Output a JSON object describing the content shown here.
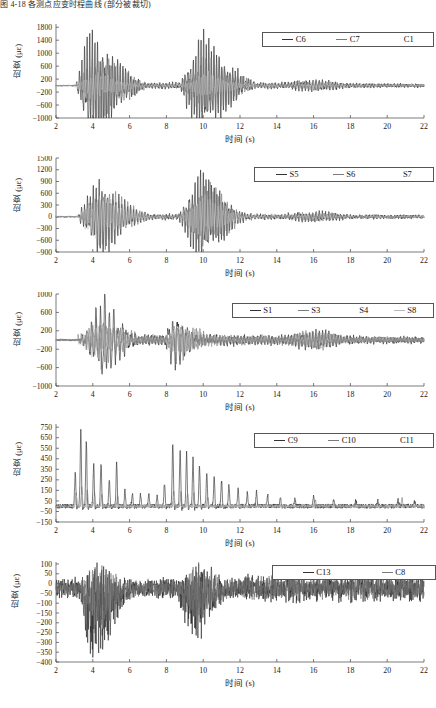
{
  "caption": {
    "top_text_clipped": "图 4-18 各测点应变时程曲线 (部分被裁切)"
  },
  "figure": {
    "axis_x_label": "时间 (s)",
    "axis_y_label": "应变 (με)",
    "x_ticks": [
      2,
      4,
      6,
      8,
      10,
      12,
      14,
      16,
      18,
      20,
      22
    ],
    "xlim": [
      2,
      22
    ]
  },
  "colors": {
    "trace_dark": "#2a2a2a",
    "trace_mid": "#6f6f6f",
    "trace_light": "#bdbdbd",
    "trace_extra": "#8c8c8c",
    "axis": "#444444",
    "text": "#1a1a1a",
    "legend_border": "#555555",
    "background": "#ffffff"
  },
  "chart_data": [
    {
      "id": "panel-1",
      "type": "line",
      "title": "",
      "xlabel": "时间 (s)",
      "ylabel": "应变 (με)",
      "xlim": [
        2,
        22
      ],
      "ylim": [
        -1000,
        1900
      ],
      "x_ticks": [
        2,
        4,
        6,
        8,
        10,
        12,
        14,
        16,
        18,
        20,
        22
      ],
      "y_ticks": [
        1800,
        1400,
        1000,
        600,
        200,
        -200,
        -600,
        -1000
      ],
      "grid": false,
      "legend_position": "top-right",
      "series": [
        {
          "name": "C6",
          "style": "dark",
          "seed": 11,
          "burst1": {
            "start": 3.1,
            "peak": 3.8,
            "end": 7.0,
            "amp": 1750,
            "freq": 7.2
          },
          "burst2": {
            "start": 8.7,
            "peak": 9.9,
            "end": 13.0,
            "amp": 1600,
            "freq": 7.0
          },
          "tail_amp": 200,
          "noise": 45,
          "baseline": 0
        },
        {
          "name": "C7",
          "style": "mid",
          "seed": 29,
          "burst1": {
            "start": 3.2,
            "peak": 4.2,
            "end": 7.4,
            "amp": 1100,
            "freq": 6.6
          },
          "burst2": {
            "start": 8.8,
            "peak": 10.3,
            "end": 13.2,
            "amp": 1000,
            "freq": 6.8
          },
          "tail_amp": 160,
          "noise": 38,
          "baseline": 0
        },
        {
          "name": "C1",
          "style": "light",
          "seed": 47,
          "burst1": {
            "start": 3.0,
            "peak": 4.0,
            "end": 7.0,
            "amp": 420,
            "freq": 7.6
          },
          "burst2": {
            "start": 8.8,
            "peak": 10.1,
            "end": 12.8,
            "amp": 380,
            "freq": 7.4
          },
          "tail_amp": 120,
          "noise": 30,
          "baseline": 0
        }
      ]
    },
    {
      "id": "panel-2",
      "type": "line",
      "title": "",
      "xlabel": "时间 (s)",
      "ylabel": "应变 (με)",
      "xlim": [
        2,
        22
      ],
      "ylim": [
        -900,
        1500
      ],
      "x_ticks": [
        2,
        4,
        6,
        8,
        10,
        12,
        14,
        16,
        18,
        20,
        22
      ],
      "y_ticks": [
        1500,
        1200,
        900,
        600,
        300,
        0,
        -300,
        -600,
        -900
      ],
      "grid": false,
      "legend_position": "top-right",
      "series": [
        {
          "name": "S5",
          "style": "dark",
          "seed": 73,
          "burst1": {
            "start": 3.2,
            "peak": 4.3,
            "end": 7.2,
            "amp": 980,
            "freq": 6.4
          },
          "burst2": {
            "start": 8.6,
            "peak": 9.8,
            "end": 12.6,
            "amp": 1180,
            "freq": 6.6
          },
          "tail_amp": 150,
          "noise": 40,
          "baseline": 0
        },
        {
          "name": "S6",
          "style": "mid",
          "seed": 97,
          "burst1": {
            "start": 3.3,
            "peak": 4.5,
            "end": 7.6,
            "amp": 760,
            "freq": 6.2
          },
          "burst2": {
            "start": 8.8,
            "peak": 10.2,
            "end": 12.8,
            "amp": 840,
            "freq": 6.4
          },
          "tail_amp": 120,
          "noise": 34,
          "baseline": 0
        },
        {
          "name": "S7",
          "style": "light",
          "seed": 131,
          "burst1": {
            "start": 3.1,
            "peak": 4.2,
            "end": 7.2,
            "amp": 560,
            "freq": 6.9
          },
          "burst2": {
            "start": 8.7,
            "peak": 10.0,
            "end": 12.4,
            "amp": 520,
            "freq": 7.1
          },
          "tail_amp": 90,
          "noise": 26,
          "baseline": 0
        }
      ]
    },
    {
      "id": "panel-3",
      "type": "line",
      "title": "",
      "xlabel": "时间 (s)",
      "ylabel": "应变 (με)",
      "xlim": [
        2,
        22
      ],
      "ylim": [
        -1000,
        1000
      ],
      "x_ticks": [
        2,
        4,
        6,
        8,
        10,
        12,
        14,
        16,
        18,
        20,
        22
      ],
      "y_ticks": [
        1000,
        600,
        200,
        -200,
        -600,
        -1000
      ],
      "grid": false,
      "legend_position": "top-right",
      "series": [
        {
          "name": "S1",
          "style": "dark",
          "seed": 151,
          "burst1": {
            "start": 3.4,
            "peak": 4.6,
            "end": 6.6,
            "amp": 930,
            "freq": 4.2
          },
          "burst2": {
            "start": 7.8,
            "peak": 8.4,
            "end": 10.0,
            "amp": 620,
            "freq": 4.0
          },
          "tail_amp": 230,
          "noise": 55,
          "baseline": 0
        },
        {
          "name": "S3",
          "style": "mid",
          "seed": 173,
          "burst1": {
            "start": 3.2,
            "peak": 4.4,
            "end": 7.0,
            "amp": 520,
            "freq": 5.2
          },
          "burst2": {
            "start": 7.8,
            "peak": 8.6,
            "end": 11.0,
            "amp": 430,
            "freq": 5.0
          },
          "tail_amp": 200,
          "noise": 48,
          "baseline": 0
        },
        {
          "name": "S4",
          "style": "light",
          "seed": 197,
          "burst1": {
            "start": 3.2,
            "peak": 4.1,
            "end": 7.0,
            "amp": 380,
            "freq": 5.8
          },
          "burst2": {
            "start": 7.9,
            "peak": 8.8,
            "end": 11.2,
            "amp": 330,
            "freq": 5.6
          },
          "tail_amp": 150,
          "noise": 36,
          "baseline": 0
        },
        {
          "name": "S8",
          "style": "extra",
          "seed": 211,
          "burst1": {
            "start": 3.3,
            "peak": 4.3,
            "end": 7.2,
            "amp": 300,
            "freq": 6.4
          },
          "burst2": {
            "start": 7.8,
            "peak": 8.7,
            "end": 11.4,
            "amp": 260,
            "freq": 6.2
          },
          "tail_amp": 170,
          "noise": 40,
          "baseline": 0
        }
      ]
    },
    {
      "id": "panel-4",
      "type": "line",
      "title": "",
      "xlabel": "时间 (s)",
      "ylabel": "应变 (με)",
      "xlim": [
        2,
        22
      ],
      "ylim": [
        -150,
        780
      ],
      "x_ticks": [
        2,
        4,
        6,
        8,
        10,
        12,
        14,
        16,
        18,
        20,
        22
      ],
      "y_ticks": [
        750,
        650,
        550,
        450,
        350,
        250,
        150,
        50,
        -50,
        -150
      ],
      "grid": false,
      "legend_position": "top-right",
      "spiky": true,
      "series": [
        {
          "name": "C9",
          "style": "dark",
          "seed": 233,
          "noise": 22,
          "baseline": 0,
          "spikes": [
            [
              3.05,
              330
            ],
            [
              3.35,
              740
            ],
            [
              3.65,
              640
            ],
            [
              4.05,
              420
            ],
            [
              4.45,
              430
            ],
            [
              4.9,
              260
            ],
            [
              5.3,
              420
            ],
            [
              5.75,
              150
            ],
            [
              6.15,
              130
            ],
            [
              6.6,
              110
            ],
            [
              7.05,
              120
            ],
            [
              7.5,
              95
            ],
            [
              7.9,
              230
            ],
            [
              8.35,
              620
            ],
            [
              8.75,
              560
            ],
            [
              9.1,
              520
            ],
            [
              9.45,
              470
            ],
            [
              9.8,
              400
            ],
            [
              10.2,
              330
            ],
            [
              10.6,
              290
            ],
            [
              11.0,
              250
            ],
            [
              11.4,
              200
            ],
            [
              11.9,
              170
            ],
            [
              12.4,
              130
            ],
            [
              12.9,
              150
            ],
            [
              13.5,
              110
            ],
            [
              14.2,
              80
            ],
            [
              15.0,
              70
            ],
            [
              16.0,
              95
            ],
            [
              17.1,
              60
            ],
            [
              18.3,
              55
            ],
            [
              19.5,
              50
            ],
            [
              20.6,
              60
            ],
            [
              21.5,
              45
            ]
          ]
        },
        {
          "name": "C10",
          "style": "mid",
          "seed": 257,
          "noise": 18,
          "baseline": 0,
          "spikes": [
            [
              3.1,
              120
            ],
            [
              3.4,
              180
            ],
            [
              3.7,
              160
            ],
            [
              4.1,
              130
            ],
            [
              4.5,
              120
            ],
            [
              5.35,
              110
            ],
            [
              8.4,
              150
            ],
            [
              8.8,
              140
            ],
            [
              9.15,
              130
            ],
            [
              9.5,
              120
            ],
            [
              10.25,
              100
            ],
            [
              16.1,
              60
            ],
            [
              20.8,
              80
            ]
          ]
        },
        {
          "name": "C11",
          "style": "light",
          "seed": 281,
          "noise": 14,
          "baseline": 0,
          "spikes": [
            [
              3.12,
              90
            ],
            [
              3.42,
              110
            ],
            [
              4.12,
              85
            ],
            [
              8.42,
              95
            ],
            [
              9.18,
              80
            ],
            [
              16.05,
              40
            ]
          ]
        }
      ]
    },
    {
      "id": "panel-5",
      "type": "line",
      "title": "",
      "xlabel": "时间 (s)",
      "ylabel": "应变 (με)",
      "xlim": [
        2,
        22
      ],
      "ylim": [
        -400,
        110
      ],
      "x_ticks": [
        2,
        4,
        6,
        8,
        10,
        12,
        14,
        16,
        18,
        20,
        22
      ],
      "y_ticks": [
        100,
        50,
        0,
        -50,
        -100,
        -150,
        -200,
        -250,
        -300,
        -350,
        -400
      ],
      "grid": false,
      "legend_position": "top-right",
      "noisy": true,
      "series": [
        {
          "name": "C13",
          "style": "dark",
          "seed": 307,
          "baseline": -25,
          "noise": 33,
          "burst1": {
            "start": 3.2,
            "peak": 4.0,
            "end": 6.3,
            "amp": 290,
            "freq": 22,
            "bias": -0.55
          },
          "burst2": {
            "start": 8.4,
            "peak": 9.6,
            "end": 11.6,
            "amp": 215,
            "freq": 21,
            "bias": -0.35
          },
          "tail_amp": 55
        },
        {
          "name": "C8",
          "style": "mid",
          "seed": 331,
          "baseline": -22,
          "noise": 27,
          "burst1": {
            "start": 3.3,
            "peak": 4.2,
            "end": 6.5,
            "amp": 170,
            "freq": 20,
            "bias": -0.4
          },
          "burst2": {
            "start": 8.5,
            "peak": 9.7,
            "end": 11.8,
            "amp": 140,
            "freq": 19,
            "bias": -0.25
          },
          "tail_amp": 45
        }
      ]
    }
  ],
  "legends": [
    {
      "panel": "panel-1",
      "items": [
        {
          "label": "C6",
          "style": "dark"
        },
        {
          "label": "C7",
          "style": "mid"
        },
        {
          "label": "C1",
          "style": "light"
        }
      ]
    },
    {
      "panel": "panel-2",
      "items": [
        {
          "label": "S5",
          "style": "dark"
        },
        {
          "label": "S6",
          "style": "mid"
        },
        {
          "label": "S7",
          "style": "light"
        }
      ]
    },
    {
      "panel": "panel-3",
      "items": [
        {
          "label": "S1",
          "style": "dark"
        },
        {
          "label": "S3",
          "style": "mid"
        },
        {
          "label": "S4",
          "style": "light"
        },
        {
          "label": "S8",
          "style": "extra"
        }
      ]
    },
    {
      "panel": "panel-4",
      "items": [
        {
          "label": "C9",
          "style": "dark"
        },
        {
          "label": "C10",
          "style": "mid"
        },
        {
          "label": "C11",
          "style": "light"
        }
      ]
    },
    {
      "panel": "panel-5",
      "items": [
        {
          "label": "C13",
          "style": "dark"
        },
        {
          "label": "C8",
          "style": "mid"
        }
      ]
    }
  ]
}
